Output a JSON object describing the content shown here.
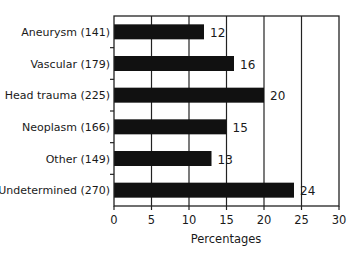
{
  "chart_data": {
    "type": "bar",
    "orientation": "horizontal",
    "title": "",
    "categories": [
      "Aneurysm (141)",
      "Vascular (179)",
      "Head trauma (225)",
      "Neoplasm (166)",
      "Other (149)",
      "Undetermined (270)"
    ],
    "values": [
      12,
      16,
      20,
      15,
      13,
      24
    ],
    "value_labels": [
      "12",
      "16",
      "20",
      "15",
      "13",
      "24"
    ],
    "xlabel": "Percentages",
    "ylabel": "",
    "xlim": [
      0,
      30
    ],
    "xticks": [
      0,
      5,
      10,
      15,
      20,
      25,
      30
    ],
    "grid": "vertical",
    "legend": null,
    "bar_color": "#111111"
  }
}
